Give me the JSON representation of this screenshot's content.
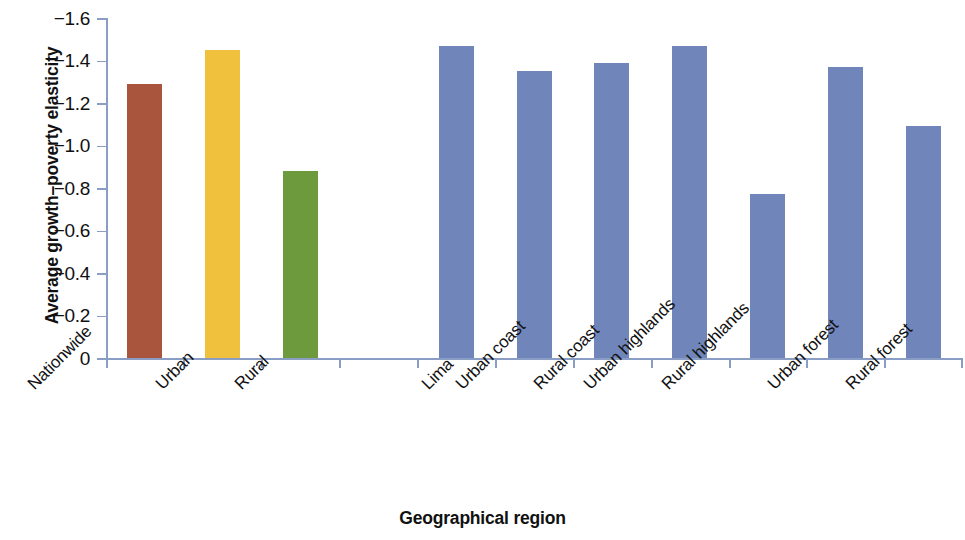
{
  "chart_data": {
    "type": "bar",
    "title": "",
    "xlabel": "Geographical region",
    "ylabel": "Average growth–poverty elasticity",
    "categories": [
      "Nationwide",
      "Urban",
      "Rural",
      "",
      "Lima",
      "Urban coast",
      "Rural coast",
      "Urban highlands",
      "Rural highlands",
      "Urban forest",
      "Rural forest"
    ],
    "values": [
      -1.29,
      -1.45,
      -0.88,
      null,
      -1.47,
      -1.35,
      -1.39,
      -1.47,
      -0.77,
      -1.37,
      -1.09
    ],
    "bar_colors": [
      "#a9543c",
      "#efc13c",
      "#6e9a3e",
      "",
      "#7085b9",
      "#7085b9",
      "#7085b9",
      "#7085b9",
      "#7085b9",
      "#7085b9",
      "#7085b9"
    ],
    "ylim": [
      0,
      -1.6
    ],
    "y_inverted": true,
    "ytick_labels": [
      "−1.6",
      "−1.4",
      "−1.2",
      "−1.0",
      "−0.8",
      "−0.6",
      "−0.4",
      "−0.2",
      "0"
    ],
    "ytick_values": [
      -1.6,
      -1.4,
      -1.2,
      -1.0,
      -0.8,
      -0.6,
      -0.4,
      -0.2,
      0
    ],
    "grid": false,
    "legend": "none",
    "axis_color": "#8a9dc4"
  },
  "axes": {
    "y_title": "Average growth–poverty elasticity",
    "x_title": "Geographical region"
  },
  "ytick_labels": {
    "t0": "−1.6",
    "t1": "−1.4",
    "t2": "−1.2",
    "t3": "−1.0",
    "t4": "−0.8",
    "t5": "−0.6",
    "t6": "−0.4",
    "t7": "−0.2",
    "t8": "0"
  },
  "categories": {
    "c0": "Nationwide",
    "c1": "Urban",
    "c2": "Rural",
    "c4": "Lima",
    "c5": "Urban coast",
    "c6": "Rural coast",
    "c7": "Urban highlands",
    "c8": "Rural highlands",
    "c9": "Urban forest",
    "c10": "Rural forest"
  }
}
